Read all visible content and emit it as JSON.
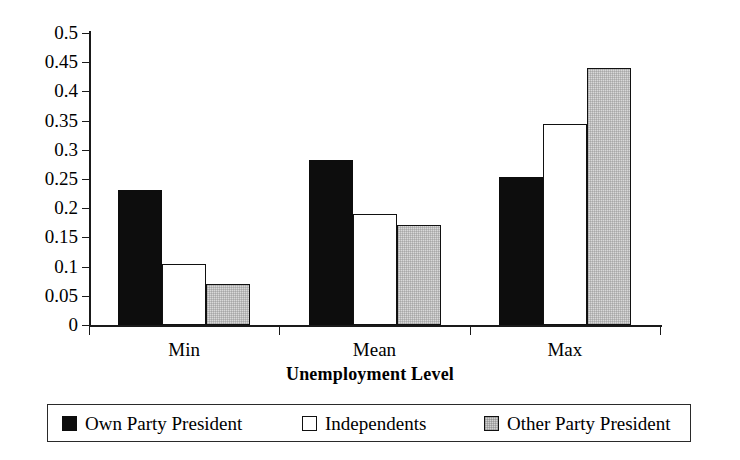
{
  "chart_data": {
    "type": "bar",
    "title": "",
    "xlabel": "Unemployment Level",
    "ylabel": "",
    "categories": [
      "Min",
      "Mean",
      "Max"
    ],
    "ylim": [
      0,
      0.5
    ],
    "ytick_step": 0.05,
    "ytick_labels": [
      "0.5",
      "0.45",
      "0.4",
      "0.35",
      "0.3",
      "0.25",
      "0.2",
      "0.15",
      "0.1",
      "0.05",
      "0"
    ],
    "ytick_values": [
      0.5,
      0.45,
      0.4,
      0.35,
      0.3,
      0.25,
      0.2,
      0.15,
      0.1,
      0.05,
      0
    ],
    "grid": false,
    "legend_position": "bottom",
    "series": [
      {
        "name": "Own Party President",
        "fill": "black",
        "color": "#0d0d0d",
        "values": [
          0.231,
          0.283,
          0.253
        ]
      },
      {
        "name": "Independents",
        "fill": "white",
        "color": "#ffffff",
        "values": [
          0.104,
          0.19,
          0.344
        ]
      },
      {
        "name": "Other Party President",
        "fill": "gray",
        "color": "#d9d9d9",
        "values": [
          0.07,
          0.171,
          0.44
        ]
      }
    ]
  }
}
